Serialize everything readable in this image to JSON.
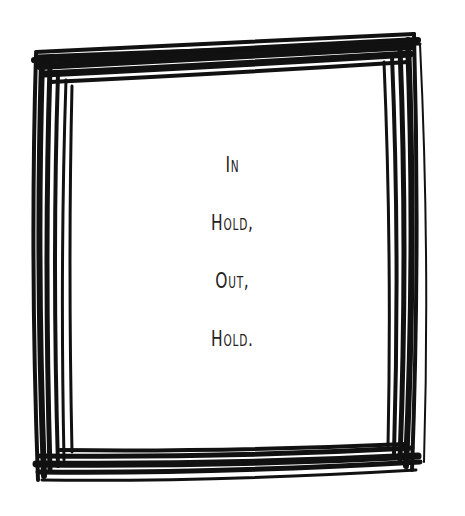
{
  "poem": {
    "lines": [
      "In",
      "Hold,",
      "Out,",
      "Hold."
    ]
  },
  "colors": {
    "ink": "#111111",
    "background": "#ffffff"
  }
}
